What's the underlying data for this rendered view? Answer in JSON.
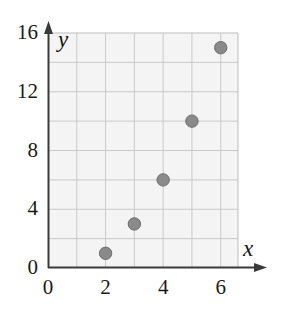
{
  "chart_data": {
    "type": "scatter",
    "title": "",
    "subtitle": "",
    "xlabel": "x",
    "ylabel": "y",
    "xlim": [
      0,
      6.6
    ],
    "ylim": [
      0,
      16
    ],
    "xticks": [
      "0",
      "2",
      "4",
      "6"
    ],
    "xtick_values": [
      0,
      2,
      4,
      6
    ],
    "yticks": [
      "0",
      "4",
      "8",
      "12",
      "16"
    ],
    "ytick_values": [
      0,
      4,
      8,
      12,
      16
    ],
    "x_gridline_step": 1,
    "y_gridline_step": 2,
    "grid": true,
    "legend": null,
    "legend_position": "none",
    "series": [
      {
        "name": "",
        "marker": "filled-circle",
        "points": [
          {
            "x": 2,
            "y": 1
          },
          {
            "x": 3,
            "y": 3
          },
          {
            "x": 4,
            "y": 6
          },
          {
            "x": 5,
            "y": 10
          },
          {
            "x": 6,
            "y": 15
          }
        ]
      }
    ]
  },
  "style": {
    "plot_background": "#f4f4f4",
    "gridline_color": "#c9c9c9",
    "axis_color": "#3a3a3a",
    "marker_fill": "#8a8a8a",
    "marker_edge": "#6e6e6e",
    "text_color": "#1a1a1a"
  },
  "axis_labels": {
    "x": "x",
    "y": "y"
  }
}
